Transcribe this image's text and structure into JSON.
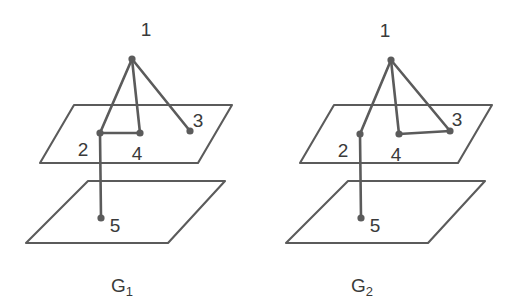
{
  "figure": {
    "background_color": "#ffffff",
    "stroke_color": "#5b5b5b",
    "label_color": "#3a3a3a"
  },
  "diagrams": [
    {
      "id": "G1",
      "caption_base": "G",
      "caption_sub": "1",
      "vertices": [
        {
          "id": "v1",
          "label": "1",
          "x": 132,
          "y": 59,
          "label_x": 146,
          "label_y": 36,
          "plane": "above-upper"
        },
        {
          "id": "v2",
          "label": "2",
          "x": 100,
          "y": 133,
          "label_x": 83,
          "label_y": 156,
          "plane": "upper"
        },
        {
          "id": "v3",
          "label": "3",
          "x": 190,
          "y": 131,
          "label_x": 198,
          "label_y": 127,
          "plane": "upper"
        },
        {
          "id": "v4",
          "label": "4",
          "x": 140,
          "y": 133,
          "label_x": 137,
          "label_y": 160,
          "plane": "upper"
        },
        {
          "id": "v5",
          "label": "5",
          "x": 101,
          "y": 218,
          "label_x": 115,
          "label_y": 232,
          "plane": "lower"
        }
      ],
      "edges": [
        {
          "from": "v1",
          "to": "v2"
        },
        {
          "from": "v1",
          "to": "v4"
        },
        {
          "from": "v1",
          "to": "v3"
        },
        {
          "from": "v2",
          "to": "v4"
        },
        {
          "from": "v2",
          "to": "v5"
        }
      ],
      "planes": [
        {
          "name": "upper-plane",
          "points": "74,105 232,105 198,163 40,163"
        },
        {
          "name": "lower-plane",
          "points": "88,181 225,181 168,243 26,243"
        }
      ],
      "caption_x": 122,
      "caption_y": 292
    },
    {
      "id": "G2",
      "caption_base": "G",
      "caption_sub": "2",
      "vertices": [
        {
          "id": "v1",
          "label": "1",
          "x": 391,
          "y": 60,
          "label_x": 385,
          "label_y": 37,
          "plane": "above-upper"
        },
        {
          "id": "v2",
          "label": "2",
          "x": 360,
          "y": 134,
          "label_x": 343,
          "label_y": 157,
          "plane": "upper"
        },
        {
          "id": "v3",
          "label": "3",
          "x": 450,
          "y": 131,
          "label_x": 457,
          "label_y": 126,
          "plane": "upper"
        },
        {
          "id": "v4",
          "label": "4",
          "x": 399,
          "y": 134,
          "label_x": 396,
          "label_y": 161,
          "plane": "upper"
        },
        {
          "id": "v5",
          "label": "5",
          "x": 361,
          "y": 218,
          "label_x": 375,
          "label_y": 232,
          "plane": "lower"
        }
      ],
      "edges": [
        {
          "from": "v1",
          "to": "v2"
        },
        {
          "from": "v1",
          "to": "v4"
        },
        {
          "from": "v1",
          "to": "v3"
        },
        {
          "from": "v4",
          "to": "v3"
        },
        {
          "from": "v2",
          "to": "v5"
        }
      ],
      "planes": [
        {
          "name": "upper-plane",
          "points": "334,105 492,105 458,163 300,163"
        },
        {
          "name": "lower-plane",
          "points": "348,181 485,181 428,243 286,243"
        }
      ],
      "caption_x": 362,
      "caption_y": 292
    }
  ]
}
